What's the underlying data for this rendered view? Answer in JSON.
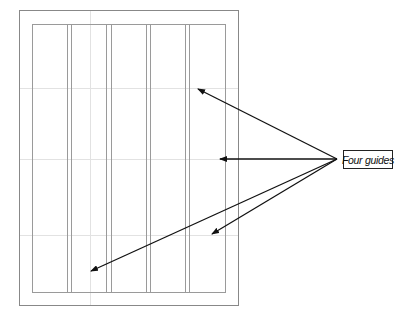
{
  "callout": {
    "label": "Four guides"
  },
  "page": {
    "outer": {
      "x": 19,
      "y": 10,
      "w": 219,
      "h": 295
    },
    "margin": {
      "x": 32,
      "y": 24,
      "w": 193,
      "h": 268
    },
    "column_lines_x": [
      67,
      71,
      106,
      111,
      146,
      150,
      185,
      189
    ],
    "guides_y": [
      88,
      159,
      235
    ],
    "guide_x": 90
  },
  "arrows": {
    "origin": {
      "x": 337,
      "y": 159
    },
    "targets": [
      {
        "x": 198,
        "y": 89
      },
      {
        "x": 220,
        "y": 159
      },
      {
        "x": 212,
        "y": 234
      },
      {
        "x": 91,
        "y": 271
      }
    ]
  },
  "colors": {
    "page_border": "#888888",
    "column_line": "#9a9a9a",
    "guide": "#e2e2e2",
    "arrow": "#111111"
  }
}
